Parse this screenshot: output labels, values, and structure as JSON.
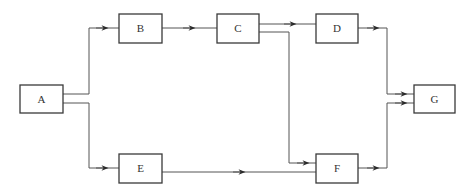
{
  "diagram": {
    "type": "flow-network",
    "colors": {
      "stroke": "#3a3a3a",
      "line": "#555555",
      "background": "#ffffff",
      "text": "#333333"
    },
    "nodes": [
      {
        "id": "A",
        "label": "A"
      },
      {
        "id": "B",
        "label": "B"
      },
      {
        "id": "C",
        "label": "C"
      },
      {
        "id": "D",
        "label": "D"
      },
      {
        "id": "E",
        "label": "E"
      },
      {
        "id": "F",
        "label": "F"
      },
      {
        "id": "G",
        "label": "G"
      }
    ],
    "edges": [
      {
        "from": "A",
        "to": "B"
      },
      {
        "from": "A",
        "to": "E"
      },
      {
        "from": "B",
        "to": "C"
      },
      {
        "from": "C",
        "to": "D"
      },
      {
        "from": "C",
        "to": "F"
      },
      {
        "from": "E",
        "to": "F"
      },
      {
        "from": "D",
        "to": "G"
      },
      {
        "from": "F",
        "to": "G"
      }
    ]
  }
}
